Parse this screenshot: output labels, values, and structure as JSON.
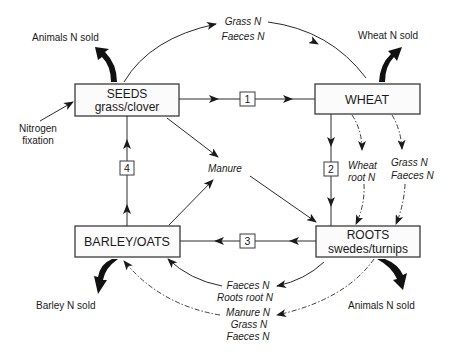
{
  "diagram": {
    "type": "crop-rotation-nitrogen-cycle",
    "nodes": {
      "seeds": {
        "title": "SEEDS",
        "subtitle": "grass/clover"
      },
      "wheat": {
        "title": "WHEAT"
      },
      "roots": {
        "title": "ROOTS",
        "subtitle": "swedes/turnips"
      },
      "barley": {
        "title": "BARLEY/OATS"
      }
    },
    "steps": [
      "1",
      "2",
      "3",
      "4"
    ],
    "outputs": {
      "seeds_sold": "Animals  N  sold",
      "wheat_sold": "Wheat  N  sold",
      "barley_sold": "Barley  N  sold",
      "roots_sold": "Animals  N  sold"
    },
    "inputs": {
      "fixation_line1": "Nitrogen",
      "fixation_line2": "fixation"
    },
    "transfers": {
      "seeds_to_wheat": [
        "Grass  N",
        "Faeces  N"
      ],
      "wheat_to_roots_root": [
        "Wheat",
        "root N"
      ],
      "wheat_to_roots_grass": [
        "Grass N",
        "Faeces N"
      ],
      "manure": "Manure",
      "roots_to_barley": [
        "Faeces N",
        "Roots root N"
      ],
      "roots_to_barley_residual": [
        "Manure N",
        "Grass N",
        "Faeces N"
      ]
    }
  }
}
